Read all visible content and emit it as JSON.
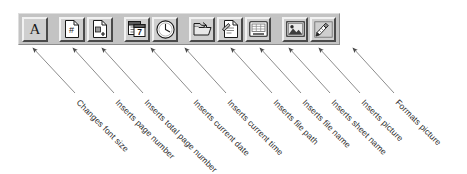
{
  "toolbar": {
    "name": "Header and Footer toolbar",
    "background_color": "#c3c3c3",
    "button_face_color": "#cfcfcf",
    "buttons": [
      {
        "icon": "font-size-icon",
        "glyph": "A",
        "label": "Changes font size",
        "tooltip": "Font"
      },
      {
        "icon": "page-number-icon",
        "glyph": "#",
        "label": "Inserts page number",
        "tooltip": "Page Number"
      },
      {
        "icon": "total-page-number-icon",
        "glyph": "+",
        "label": "Inserts total page number",
        "tooltip": "Total Pages"
      },
      {
        "icon": "calendar-date-icon",
        "glyph": "7",
        "label": "Inserts current date",
        "tooltip": "Date"
      },
      {
        "icon": "clock-time-icon",
        "glyph": "",
        "label": "Inserts current time",
        "tooltip": "Time"
      },
      {
        "icon": "folder-path-icon",
        "glyph": "",
        "label": "Inserts file path",
        "tooltip": "File Path"
      },
      {
        "icon": "file-name-icon",
        "glyph": "",
        "label": "Inserts file name",
        "tooltip": "File Name"
      },
      {
        "icon": "sheet-name-icon",
        "glyph": "",
        "label": "Inserts sheet name",
        "tooltip": "Sheet Name"
      },
      {
        "icon": "insert-picture-icon",
        "glyph": "",
        "label": "Inserts picture",
        "tooltip": "Insert Picture"
      },
      {
        "icon": "format-picture-icon",
        "glyph": "",
        "label": "Formats picture",
        "tooltip": "Format Picture"
      }
    ],
    "separator_after_indices": [
      0,
      2,
      4
    ]
  },
  "colors": {
    "page_background": "#ffffff",
    "toolbar_face": "#c3c3c3",
    "button_face": "#cfcfcf",
    "bevel_light": "#f2f2f2",
    "bevel_dark": "#4a4a4a",
    "leader_line": "#6e6e6e",
    "text": "#2b2b2b"
  }
}
